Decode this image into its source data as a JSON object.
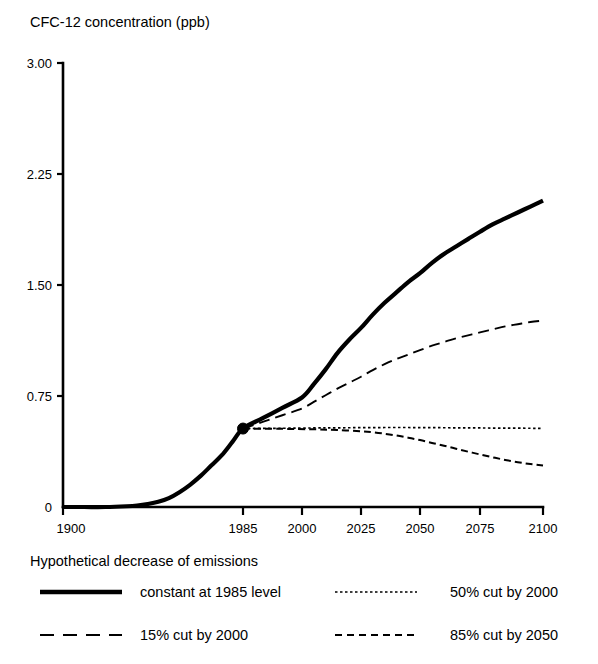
{
  "chart_data": {
    "type": "line",
    "title": "CFC-12 concentration (ppb)",
    "xlabel": "",
    "ylabel": "CFC-12 concentration (ppb)",
    "grid": false,
    "legend_position": "bottom",
    "legend_title": "Hypothetical decrease of emissions",
    "xlim": [
      1900,
      2100
    ],
    "ylim": [
      0,
      3.0
    ],
    "x_ticks": [
      1900,
      1985,
      2000,
      2025,
      2050,
      2075,
      2100
    ],
    "x_tick_labels": [
      "1900",
      "1985",
      "2000",
      "2025",
      "2050",
      "2075",
      "2100"
    ],
    "y_ticks": [
      0,
      0.75,
      1.5,
      2.25,
      3.0
    ],
    "y_tick_labels": [
      "0",
      "0.75",
      "1.50",
      "2.25",
      "3.00"
    ],
    "annotations": [
      {
        "name": "branch-point-marker",
        "x": 1985,
        "y": 0.53,
        "label": ""
      }
    ],
    "series": [
      {
        "name": "constant at 1985 level",
        "style": "solid",
        "width": 4.2,
        "dash": "",
        "x": [
          1900,
          1910,
          1920,
          1930,
          1935,
          1940,
          1945,
          1950,
          1955,
          1960,
          1965,
          1970,
          1975,
          1980,
          1985,
          1990,
          1995,
          2000,
          2005,
          2010,
          2015,
          2020,
          2025,
          2030,
          2035,
          2040,
          2045,
          2050,
          2055,
          2060,
          2065,
          2070,
          2075,
          2080,
          2085,
          2090,
          2095,
          2100
        ],
        "y": [
          0,
          0,
          0,
          0.005,
          0.01,
          0.02,
          0.035,
          0.06,
          0.1,
          0.15,
          0.21,
          0.28,
          0.35,
          0.44,
          0.53,
          0.6,
          0.67,
          0.74,
          0.83,
          0.93,
          1.04,
          1.13,
          1.21,
          1.3,
          1.38,
          1.45,
          1.52,
          1.58,
          1.65,
          1.71,
          1.76,
          1.81,
          1.86,
          1.91,
          1.95,
          1.99,
          2.03,
          2.07
        ]
      },
      {
        "name": "15% cut by 2000",
        "style": "long-dash",
        "width": 1.9,
        "dash": "11 6",
        "x": [
          1985,
          1990,
          1995,
          2000,
          2005,
          2010,
          2015,
          2020,
          2025,
          2030,
          2035,
          2040,
          2045,
          2050,
          2055,
          2060,
          2065,
          2070,
          2075,
          2080,
          2085,
          2090,
          2095,
          2100
        ],
        "y": [
          0.53,
          0.575,
          0.62,
          0.665,
          0.71,
          0.755,
          0.8,
          0.84,
          0.88,
          0.925,
          0.965,
          1.0,
          1.03,
          1.06,
          1.09,
          1.115,
          1.14,
          1.16,
          1.18,
          1.2,
          1.22,
          1.235,
          1.25,
          1.26
        ]
      },
      {
        "name": "50% cut by 2000",
        "style": "fine-dot",
        "width": 1.7,
        "dash": "2.5 2.5",
        "x": [
          1985,
          1995,
          2005,
          2015,
          2025,
          2035,
          2045,
          2055,
          2065,
          2075,
          2085,
          2095,
          2100
        ],
        "y": [
          0.53,
          0.532,
          0.534,
          0.535,
          0.536,
          0.537,
          0.537,
          0.536,
          0.535,
          0.534,
          0.533,
          0.532,
          0.531
        ]
      },
      {
        "name": "85% cut by 2050",
        "style": "dash",
        "width": 2.0,
        "dash": "7 4",
        "x": [
          1985,
          1995,
          2005,
          2015,
          2025,
          2030,
          2035,
          2040,
          2045,
          2050,
          2055,
          2060,
          2065,
          2070,
          2075,
          2080,
          2085,
          2090,
          2095,
          2100
        ],
        "y": [
          0.53,
          0.528,
          0.525,
          0.52,
          0.512,
          0.505,
          0.495,
          0.483,
          0.468,
          0.452,
          0.433,
          0.414,
          0.394,
          0.374,
          0.355,
          0.336,
          0.318,
          0.303,
          0.29,
          0.28
        ]
      }
    ]
  },
  "legend": {
    "title": "Hypothetical decrease of emissions",
    "entries": [
      {
        "label": "constant at 1985 level",
        "style": "solid",
        "column": 0,
        "row": 0
      },
      {
        "label": "50% cut by 2000",
        "style": "fine-dot",
        "column": 1,
        "row": 0
      },
      {
        "label": "15% cut by 2000",
        "style": "long-dash",
        "column": 0,
        "row": 1
      },
      {
        "label": "85% cut by 2050",
        "style": "dash",
        "column": 1,
        "row": 1
      }
    ]
  },
  "colors": {
    "ink": "#000000",
    "background": "#ffffff"
  }
}
